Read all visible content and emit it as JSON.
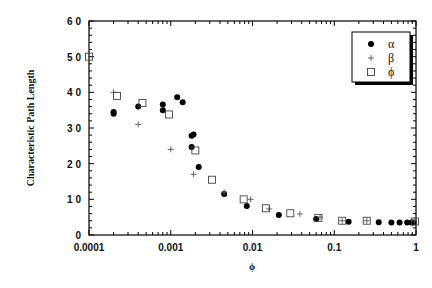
{
  "chart_data": {
    "type": "scatter",
    "title": "",
    "xlabel": "ϕ",
    "ylabel": "Characteristic Path Length",
    "xscale": "log",
    "xlim": [
      0.0001,
      1
    ],
    "ylim": [
      0,
      60
    ],
    "x_ticks": [
      "0.0001",
      "0.001",
      "0.01",
      "0.1",
      "1"
    ],
    "y_ticks": [
      "0",
      "1 0",
      "2 0",
      "3 0",
      "4 0",
      "5 0",
      "6 0"
    ],
    "grid": false,
    "legend_position": "upper right",
    "series": [
      {
        "name": "α",
        "marker": "filled-circle",
        "points": [
          [
            0.0002,
            34.5
          ],
          [
            0.0002,
            34.0
          ],
          [
            0.0004,
            36.0
          ],
          [
            0.0008,
            36.6
          ],
          [
            0.0008,
            35.0
          ],
          [
            0.0012,
            38.6
          ],
          [
            0.0014,
            37.2
          ],
          [
            0.0018,
            27.8
          ],
          [
            0.0019,
            28.2
          ],
          [
            0.0018,
            24.7
          ],
          [
            0.0022,
            19.1
          ],
          [
            0.0045,
            11.5
          ],
          [
            0.0085,
            8.1
          ],
          [
            0.021,
            5.6
          ],
          [
            0.06,
            4.5
          ],
          [
            0.15,
            3.7
          ],
          [
            0.35,
            3.6
          ],
          [
            0.5,
            3.5
          ],
          [
            0.63,
            3.5
          ],
          [
            0.78,
            3.5
          ],
          [
            0.88,
            3.5
          ],
          [
            0.93,
            3.5
          ]
        ]
      },
      {
        "name": "β",
        "marker": "plus",
        "points": [
          [
            0.0002,
            40.0
          ],
          [
            0.0004,
            31.0
          ],
          [
            0.001,
            24.0
          ],
          [
            0.0019,
            17.0
          ],
          [
            0.0045,
            12.0
          ],
          [
            0.0095,
            10.0
          ],
          [
            0.016,
            7.3
          ],
          [
            0.038,
            5.9
          ],
          [
            0.067,
            5.0
          ],
          [
            0.125,
            4.0
          ],
          [
            0.25,
            4.0
          ],
          [
            0.95,
            4.0
          ]
        ]
      },
      {
        "name": "ϕ",
        "marker": "open-square",
        "points": [
          [
            0.0001,
            50.0
          ],
          [
            0.00022,
            39.0
          ],
          [
            0.00045,
            37.0
          ],
          [
            0.00095,
            33.8
          ],
          [
            0.002,
            23.7
          ],
          [
            0.0032,
            15.5
          ],
          [
            0.0078,
            10.0
          ],
          [
            0.0146,
            7.5
          ],
          [
            0.029,
            6.1
          ],
          [
            0.064,
            4.8
          ],
          [
            0.125,
            4.0
          ],
          [
            0.25,
            4.0
          ],
          [
            0.97,
            3.8
          ]
        ]
      }
    ]
  },
  "legend": {
    "items": [
      {
        "label": "α",
        "marker": "filled-circle"
      },
      {
        "label": "β",
        "marker": "plus"
      },
      {
        "label": "ϕ",
        "marker": "open-square"
      }
    ]
  },
  "axes": {
    "xlabel": "ϕ",
    "ylabel": "Characteristic Path Length"
  }
}
